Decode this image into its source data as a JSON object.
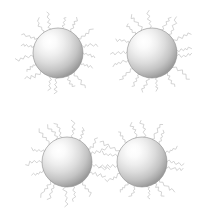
{
  "figure": {
    "background_color": "#ffffff",
    "width": 206,
    "height": 211
  },
  "style": {
    "sphere_highlight_color": "#ffffff",
    "sphere_mid_color": "#d8d8d8",
    "sphere_edge_color": "#9a9a9a",
    "sphere_rim_color": "#8c8c8c",
    "ligand_color": "#c9c9c9",
    "ligand_stroke_width": 0.8,
    "highlight_offset_x": "35%",
    "highlight_offset_y": "30%"
  },
  "particles": [
    {
      "id": "particle-top-left",
      "label": "Top-left nanoparticle",
      "cx": 58,
      "cy": 53,
      "r": 25,
      "ligand_count": 17,
      "ligand_length": 22,
      "seed": 11,
      "angle_offset": 4
    },
    {
      "id": "particle-top-right",
      "label": "Top-right nanoparticle",
      "cx": 152,
      "cy": 53,
      "r": 25,
      "ligand_count": 17,
      "ligand_length": 22,
      "seed": 27,
      "angle_offset": 12
    },
    {
      "id": "particle-bottom-left",
      "label": "Bottom-left nanoparticle",
      "cx": 67,
      "cy": 162,
      "r": 25,
      "ligand_count": 17,
      "ligand_length": 22,
      "seed": 43,
      "angle_offset": 9
    },
    {
      "id": "particle-bottom-right",
      "label": "Bottom-right nanoparticle",
      "cx": 142,
      "cy": 162,
      "r": 25,
      "ligand_count": 17,
      "ligand_length": 22,
      "seed": 61,
      "angle_offset": 21
    }
  ],
  "groups": [
    {
      "id": "pair-top",
      "label": "Top separated particle pair",
      "members": [
        "particle-top-left",
        "particle-top-right"
      ],
      "separated": true
    },
    {
      "id": "pair-bottom",
      "label": "Bottom contacting particle pair",
      "members": [
        "particle-bottom-left",
        "particle-bottom-right"
      ],
      "separated": false
    }
  ]
}
